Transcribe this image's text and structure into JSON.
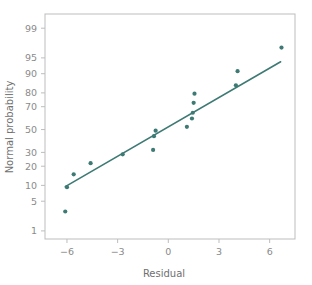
{
  "chart_data": {
    "type": "scatter",
    "title": "",
    "xlabel": "Residual",
    "ylabel": "Normal probability",
    "xlim": [
      -7.3,
      7.5
    ],
    "ylim_probability": [
      0.6,
      99.6
    ],
    "y_scale": "normal probability (probit)",
    "grid": false,
    "legend": null,
    "xticks": [
      -6,
      -3,
      0,
      3,
      6
    ],
    "xtick_labels": [
      "−6",
      "−3",
      "0",
      "3",
      "6"
    ],
    "yticks": [
      1,
      5,
      10,
      20,
      30,
      50,
      70,
      80,
      90,
      95,
      99
    ],
    "ytick_labels": [
      "1",
      "5",
      "10",
      "20",
      "30",
      "50",
      "70",
      "80",
      "90",
      "95",
      "99"
    ],
    "marker_color": "#3d7a73",
    "line_color": "#3d7a73",
    "points": [
      {
        "x": -6.1,
        "y": 3.0
      },
      {
        "x": -6.0,
        "y": 9.3
      },
      {
        "x": -5.6,
        "y": 15.2
      },
      {
        "x": -4.6,
        "y": 22.0
      },
      {
        "x": -2.7,
        "y": 28.5
      },
      {
        "x": -0.9,
        "y": 32.0
      },
      {
        "x": -0.85,
        "y": 44.0
      },
      {
        "x": -0.75,
        "y": 49.0
      },
      {
        "x": 1.1,
        "y": 52.5
      },
      {
        "x": 1.4,
        "y": 60.0
      },
      {
        "x": 1.45,
        "y": 65.0
      },
      {
        "x": 1.5,
        "y": 73.0
      },
      {
        "x": 1.55,
        "y": 79.5
      },
      {
        "x": 4.0,
        "y": 84.5
      },
      {
        "x": 4.1,
        "y": 91.0
      },
      {
        "x": 6.7,
        "y": 97.0
      }
    ],
    "reference_line": {
      "x_start": -6.1,
      "y_start": 9.5,
      "x_end": 6.65,
      "y_end": 94.0
    }
  },
  "axis": {
    "x_title": "Residual",
    "y_title": "Normal probability"
  }
}
